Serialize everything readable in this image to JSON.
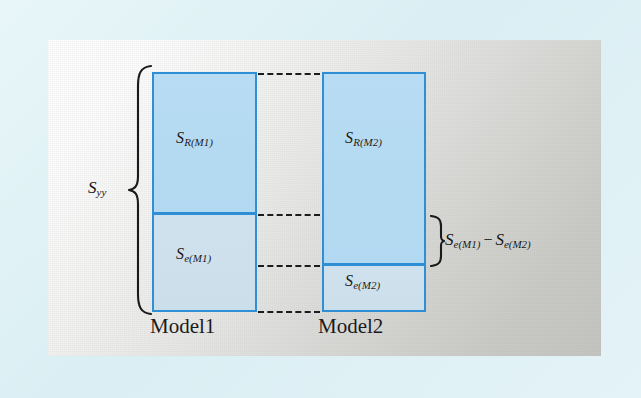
{
  "figure": {
    "type": "diagram",
    "background_color": "#dff1f5",
    "panel_color": "#d7d7d4",
    "box_border_color": "#2e8ed6",
    "box_upper_fill": "#b7dcf3",
    "box_lower_fill": "#cfe1ec",
    "dash_color": "#1c1c1c"
  },
  "total_brace": {
    "symbol": "S",
    "subscript": "yy",
    "name": "total-sum-of-squares"
  },
  "columns": [
    {
      "caption": "Model1",
      "segments": [
        {
          "symbol": "S",
          "subscript": "R(M1)",
          "role": "regression"
        },
        {
          "symbol": "S",
          "subscript": "e(M1)",
          "role": "error"
        }
      ]
    },
    {
      "caption": "Model2",
      "segments": [
        {
          "symbol": "S",
          "subscript": "R(M2)",
          "role": "regression"
        },
        {
          "symbol": "S",
          "subscript": "e(M2)",
          "role": "error"
        }
      ]
    }
  ],
  "difference_brace": {
    "left_symbol": "S",
    "left_subscript": "e(M1)",
    "operator": "−",
    "right_symbol": "S",
    "right_subscript": "e(M2)",
    "name": "extra-sum-of-squares"
  }
}
